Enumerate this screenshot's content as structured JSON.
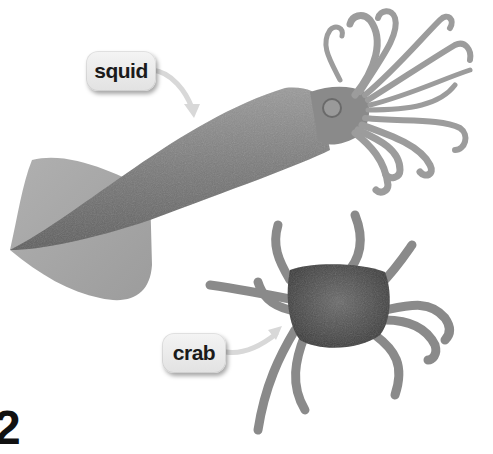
{
  "labels": {
    "squid": "squid",
    "crab": "crab"
  },
  "page_number": "2",
  "animals": [
    {
      "name": "squid",
      "image": "squid-photo"
    },
    {
      "name": "crab",
      "image": "crab-photo"
    }
  ],
  "colors": {
    "background": "#ffffff",
    "label_bg": "#ebebeb",
    "label_text": "#1a1a1a",
    "arrow": "#e6e6e6"
  }
}
